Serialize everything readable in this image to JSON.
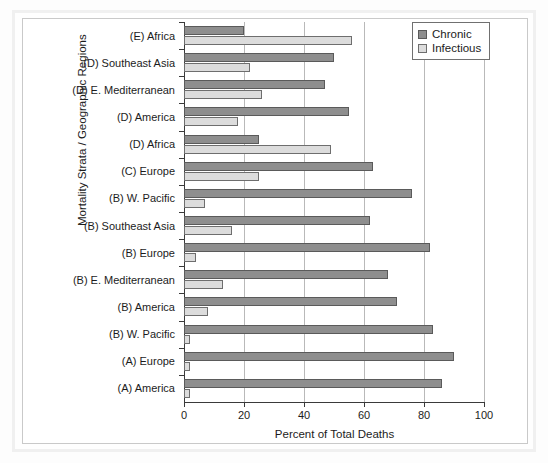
{
  "chart_data": {
    "type": "bar",
    "orientation": "horizontal",
    "title": "",
    "xlabel": "Percent of Total Deaths",
    "ylabel": "Mortality Strata / Geographic Regions",
    "xlim": [
      0,
      100
    ],
    "xticks": [
      "0",
      "20",
      "40",
      "60",
      "80",
      "100"
    ],
    "grid": true,
    "legend_position": "top-right",
    "categories": [
      "(E) Africa",
      "(D) Southeast Asia",
      "(D) E. Mediterranean",
      "(D) America",
      "(D) Africa",
      "(C) Europe",
      "(B) W. Pacific",
      "(B) Southeast Asia",
      "(B) Europe",
      "(B) E. Mediterranean",
      "(B) America",
      "(B) W. Pacific",
      "(A) Europe",
      "(A) America"
    ],
    "series": [
      {
        "name": "Chronic",
        "color": "#8e8e8e",
        "values": [
          20,
          50,
          47,
          55,
          25,
          63,
          76,
          62,
          82,
          68,
          71,
          83,
          90,
          86
        ]
      },
      {
        "name": "Infectious",
        "color": "#dcdcdc",
        "values": [
          56,
          22,
          26,
          18,
          49,
          25,
          7,
          16,
          4,
          13,
          8,
          2,
          2,
          2
        ]
      }
    ]
  },
  "legend": {
    "items": [
      {
        "label": "Chronic"
      },
      {
        "label": "Infectious"
      }
    ]
  }
}
